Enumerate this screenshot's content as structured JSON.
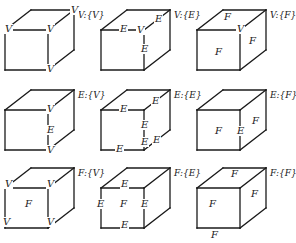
{
  "figure": {
    "rows": [
      "V",
      "E",
      "F"
    ],
    "columns": [
      "V",
      "E",
      "F"
    ],
    "cells": [
      {
        "caption": "V:{V}",
        "labels": [
          {
            "t": "V",
            "x": 71,
            "y": 13
          },
          {
            "t": "V",
            "x": 5,
            "y": 32
          },
          {
            "t": "V",
            "x": 47,
            "y": 32
          },
          {
            "t": "V",
            "x": 47,
            "y": 72
          }
        ],
        "hidden_edges": [
          "front-top-right",
          "front-right-mid",
          "front-mid-bottom"
        ]
      },
      {
        "caption": "V:{E}",
        "labels": [
          {
            "t": "E",
            "x": 120,
            "y": 32
          },
          {
            "t": "V",
            "x": 137,
            "y": 33
          },
          {
            "t": "E",
            "x": 155,
            "y": 22
          },
          {
            "t": "E",
            "x": 141,
            "y": 52
          }
        ]
      },
      {
        "caption": "V:{F}",
        "labels": [
          {
            "t": "F",
            "x": 224,
            "y": 20
          },
          {
            "t": "V",
            "x": 237,
            "y": 32
          },
          {
            "t": "F",
            "x": 249,
            "y": 44
          },
          {
            "t": "F",
            "x": 215,
            "y": 55
          }
        ]
      },
      {
        "caption": "E:{V}",
        "labels": [
          {
            "t": "V",
            "x": 47,
            "y": 112
          },
          {
            "t": "E",
            "x": 47,
            "y": 133
          },
          {
            "t": "V",
            "x": 47,
            "y": 153
          }
        ]
      },
      {
        "caption": "E:{E}",
        "labels": [
          {
            "t": "E",
            "x": 120,
            "y": 112
          },
          {
            "t": "E",
            "x": 152,
            "y": 104
          },
          {
            "t": "E",
            "x": 141,
            "y": 128
          },
          {
            "t": "E",
            "x": 141,
            "y": 145
          },
          {
            "t": "E",
            "x": 153,
            "y": 143
          },
          {
            "t": "E",
            "x": 116,
            "y": 152
          }
        ]
      },
      {
        "caption": "E:{F}",
        "labels": [
          {
            "t": "F",
            "x": 215,
            "y": 134
          },
          {
            "t": "E",
            "x": 237,
            "y": 134
          },
          {
            "t": "F",
            "x": 252,
            "y": 124
          }
        ]
      },
      {
        "caption": "F:{V}",
        "labels": [
          {
            "t": "V",
            "x": 5,
            "y": 187
          },
          {
            "t": "V",
            "x": 47,
            "y": 187
          },
          {
            "t": "F",
            "x": 25,
            "y": 207
          },
          {
            "t": "V",
            "x": 3,
            "y": 225
          },
          {
            "t": "V",
            "x": 47,
            "y": 225
          }
        ]
      },
      {
        "caption": "F:{E}",
        "labels": [
          {
            "t": "E",
            "x": 121,
            "y": 187
          },
          {
            "t": "E",
            "x": 97,
            "y": 207
          },
          {
            "t": "F",
            "x": 120,
            "y": 207
          },
          {
            "t": "E",
            "x": 141,
            "y": 207
          },
          {
            "t": "E",
            "x": 121,
            "y": 228
          }
        ]
      },
      {
        "caption": "F:{F}",
        "labels": [
          {
            "t": "F",
            "x": 231,
            "y": 177
          },
          {
            "t": "F",
            "x": 209,
            "y": 207
          },
          {
            "t": "F",
            "x": 251,
            "y": 197
          },
          {
            "t": "F",
            "x": 211,
            "y": 238
          }
        ]
      }
    ]
  }
}
